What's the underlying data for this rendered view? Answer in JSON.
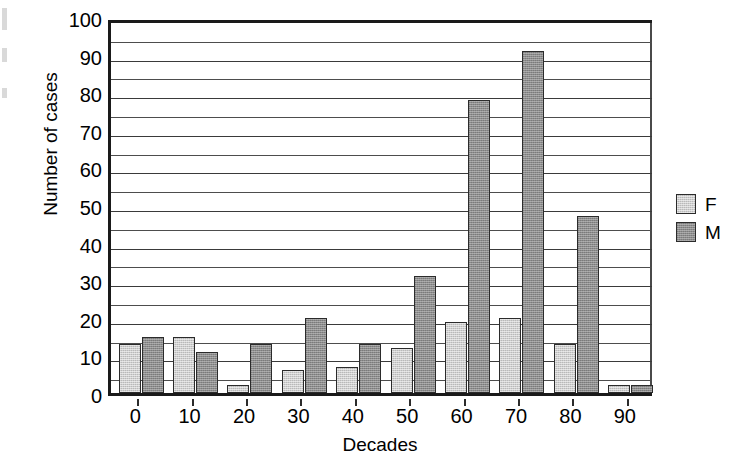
{
  "chart_data": {
    "type": "bar",
    "title": "",
    "xlabel": "Decades",
    "ylabel": "Number of cases",
    "categories": [
      "0",
      "10",
      "20",
      "30",
      "40",
      "50",
      "60",
      "70",
      "80",
      "90"
    ],
    "series": [
      {
        "name": "F",
        "color": "#b9b9b9",
        "values": [
          13,
          15,
          2,
          6,
          7,
          12,
          19,
          20,
          13,
          2
        ]
      },
      {
        "name": "M",
        "color": "#8c8c8c",
        "values": [
          15,
          11,
          13,
          20,
          13,
          31,
          78,
          91,
          47,
          2
        ]
      }
    ],
    "ylim": [
      0,
      100
    ],
    "ytick_labels": [
      "0",
      "10",
      "20",
      "30",
      "40",
      "50",
      "60",
      "70",
      "80",
      "90",
      "100"
    ],
    "ytick_values": [
      0,
      10,
      20,
      30,
      40,
      50,
      60,
      70,
      80,
      90,
      100
    ],
    "gridline_values": [
      5,
      10,
      15,
      20,
      25,
      30,
      35,
      40,
      45,
      50,
      55,
      60,
      65,
      70,
      75,
      80,
      85,
      90,
      95
    ],
    "grid": true,
    "legend": {
      "position": "right",
      "entries": [
        {
          "label": "F",
          "color": "#b9b9b9"
        },
        {
          "label": "M",
          "color": "#8c8c8c"
        }
      ]
    }
  }
}
